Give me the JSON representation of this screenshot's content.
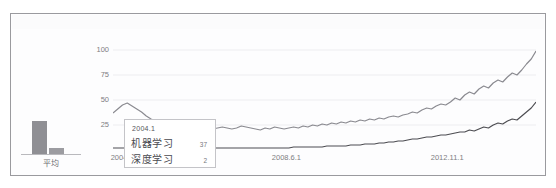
{
  "panel": {
    "background_color": "#fdfdfe",
    "border_color": "#9a9a9e"
  },
  "bar_panel": {
    "category_label": "平均"
  },
  "tooltip": {
    "title": "2004.1",
    "rows": [
      {
        "name": "机器学习",
        "value": "37"
      },
      {
        "name": "深度学习",
        "value": "2"
      }
    ]
  },
  "chart_data": {
    "type": "line",
    "title": "",
    "xlabel": "",
    "ylabel": "",
    "grid": true,
    "legend_position": "none",
    "ylim": [
      0,
      108
    ],
    "yticks": [
      100,
      75,
      50,
      25
    ],
    "xticks": [
      "2004.1.1",
      "2008.6.1",
      "2012.11.1"
    ],
    "xtick_positions": [
      0.0,
      0.41,
      0.79
    ],
    "colors": {
      "机器学习": "#8a8a90",
      "深度学习": "#4d4d52"
    },
    "x": [
      "2004.1",
      "2004.3",
      "2004.5",
      "2004.7",
      "2004.9",
      "2004.11",
      "2005.1",
      "2005.3",
      "2005.5",
      "2005.7",
      "2005.9",
      "2005.11",
      "2006.1",
      "2006.3",
      "2006.5",
      "2006.7",
      "2006.9",
      "2006.11",
      "2007.1",
      "2007.3",
      "2007.5",
      "2007.7",
      "2007.9",
      "2007.11",
      "2008.1",
      "2008.3",
      "2008.6",
      "2008.8",
      "2008.10",
      "2008.12",
      "2009.2",
      "2009.4",
      "2009.6",
      "2009.8",
      "2009.10",
      "2009.12",
      "2010.2",
      "2010.4",
      "2010.6",
      "2010.8",
      "2010.10",
      "2010.12",
      "2011.2",
      "2011.4",
      "2011.6",
      "2011.8",
      "2011.10",
      "2011.12",
      "2012.2",
      "2012.4",
      "2012.6",
      "2012.8",
      "2012.11",
      "2013.1",
      "2013.3",
      "2013.5",
      "2013.7",
      "2013.9",
      "2013.11",
      "2014.1",
      "2014.3",
      "2014.5",
      "2014.7",
      "2014.9",
      "2014.11",
      "2015.1",
      "2015.3",
      "2015.5",
      "2015.7",
      "2015.9",
      "2015.11",
      "2016.1",
      "2016.3",
      "2016.5",
      "2016.7",
      "2016.9",
      "2016.11",
      "2017.1",
      "2017.3",
      "2017.5",
      "2017.7",
      "2017.9",
      "2017.11",
      "2018.1",
      "2018.3",
      "2018.5",
      "2018.7",
      "2018.9",
      "2018.11",
      "2019.1"
    ],
    "series": [
      {
        "name": "机器学习",
        "color": "#8a8a90",
        "values": [
          37,
          41,
          45,
          47,
          44,
          41,
          38,
          34,
          31,
          29,
          27,
          26,
          25,
          24,
          24,
          23,
          23,
          22,
          22,
          23,
          22,
          21,
          22,
          23,
          22,
          21,
          22,
          24,
          23,
          22,
          21,
          20,
          22,
          21,
          23,
          22,
          21,
          22,
          23,
          22,
          24,
          23,
          25,
          24,
          26,
          25,
          27,
          26,
          28,
          27,
          29,
          28,
          30,
          29,
          31,
          30,
          32,
          31,
          33,
          34,
          33,
          35,
          36,
          38,
          37,
          40,
          42,
          41,
          44,
          46,
          45,
          48,
          52,
          50,
          55,
          58,
          56,
          61,
          64,
          62,
          67,
          70,
          68,
          73,
          77,
          75,
          80,
          86,
          91,
          99
        ]
      },
      {
        "name": "深度学习",
        "color": "#4d4d52",
        "values": [
          2,
          2,
          2,
          2,
          2,
          2,
          2,
          2,
          2,
          2,
          2,
          2,
          2,
          2,
          2,
          2,
          2,
          2,
          2,
          2,
          2,
          2,
          2,
          2,
          2,
          2,
          2,
          2,
          2,
          2,
          2,
          2,
          2,
          2,
          2,
          2,
          2,
          2,
          3,
          3,
          3,
          3,
          3,
          3,
          3,
          4,
          4,
          4,
          4,
          4,
          5,
          5,
          5,
          6,
          6,
          6,
          7,
          7,
          8,
          8,
          9,
          9,
          10,
          11,
          11,
          12,
          13,
          13,
          14,
          15,
          15,
          16,
          17,
          18,
          18,
          20,
          19,
          21,
          23,
          22,
          25,
          27,
          26,
          29,
          31,
          30,
          34,
          38,
          42,
          48
        ]
      }
    ]
  },
  "bar_chart_data": {
    "type": "bar",
    "categories": [
      "平均"
    ],
    "series": [
      {
        "name": "机器学习",
        "values": [
          33
        ],
        "color": "#8f8f94"
      },
      {
        "name": "深度学习",
        "values": [
          6
        ],
        "color": "#9c9ca1"
      }
    ],
    "ylim": [
      0,
      40
    ]
  }
}
